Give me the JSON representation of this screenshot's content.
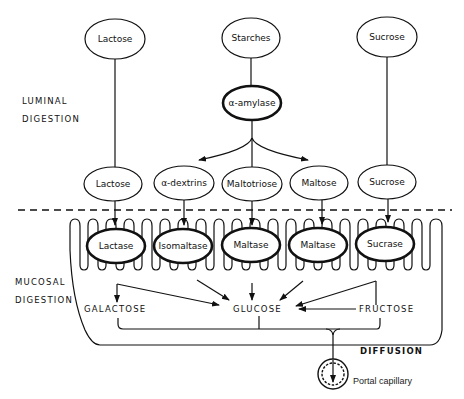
{
  "diagram": {
    "sections": {
      "luminal": {
        "line1": "LUMINAL",
        "line2": "DIGESTION"
      },
      "mucosal": {
        "line1": "MUCOSAL",
        "line2": "DIGESTION"
      }
    },
    "sources": [
      {
        "id": "lactose-src",
        "label": "Lactose"
      },
      {
        "id": "starches-src",
        "label": "Starches"
      },
      {
        "id": "sucrose-src",
        "label": "Sucrose"
      }
    ],
    "luminal_enzyme": {
      "label": "α-amylase"
    },
    "intermediates": [
      {
        "id": "lactose",
        "label": "Lactose"
      },
      {
        "id": "alpha-dextrins",
        "label": "α-dextrins"
      },
      {
        "id": "maltotriose",
        "label": "Maltotriose"
      },
      {
        "id": "maltose",
        "label": "Maltose"
      },
      {
        "id": "sucrose",
        "label": "Sucrose"
      }
    ],
    "brush_border_enzymes": [
      {
        "id": "lactase",
        "label": "Lactase"
      },
      {
        "id": "isomaltase",
        "label": "Isomaltase"
      },
      {
        "id": "maltase-1",
        "label": "Maltase"
      },
      {
        "id": "maltase-2",
        "label": "Maltase"
      },
      {
        "id": "sucrase",
        "label": "Sucrase"
      }
    ],
    "products": {
      "galactose": "GALACTOSE",
      "glucose": "GLUCOSE",
      "fructose": "FRUCTOSE"
    },
    "diffusion_label": "DIFFUSION",
    "capillary_label": "Portal capillary"
  }
}
